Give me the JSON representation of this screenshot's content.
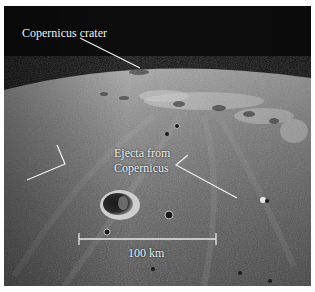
{
  "figure": {
    "labels": {
      "crater": "Copernicus crater",
      "ejecta_line1": "Ejecta from",
      "ejecta_line2": "Copernicus",
      "scale": "100 km"
    },
    "colors": {
      "sky": "#0d0d0d",
      "surface_light": "#9a9a9a",
      "surface_dark": "#4a4a4a",
      "annotation": "#f2f2f2"
    }
  }
}
